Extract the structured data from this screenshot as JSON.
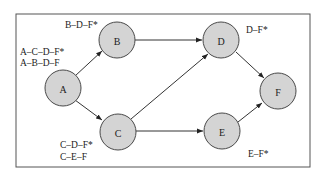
{
  "diagram": {
    "type": "directed-network",
    "nodes": [
      {
        "id": "A",
        "label": "A",
        "x": 63,
        "y": 88
      },
      {
        "id": "B",
        "label": "B",
        "x": 117,
        "y": 40
      },
      {
        "id": "C",
        "label": "C",
        "x": 118,
        "y": 132
      },
      {
        "id": "D",
        "label": "D",
        "x": 221,
        "y": 40
      },
      {
        "id": "E",
        "label": "E",
        "x": 222,
        "y": 131
      },
      {
        "id": "F",
        "label": "F",
        "x": 278,
        "y": 91
      }
    ],
    "edges": [
      {
        "from": "A",
        "to": "B"
      },
      {
        "from": "A",
        "to": "C"
      },
      {
        "from": "B",
        "to": "D"
      },
      {
        "from": "C",
        "to": "D"
      },
      {
        "from": "C",
        "to": "E"
      },
      {
        "from": "D",
        "to": "F"
      },
      {
        "from": "E",
        "to": "F"
      }
    ],
    "path_labels": {
      "A": [
        "A–C–D–F*",
        "A–B–D–F"
      ],
      "B": [
        "B–D–F*"
      ],
      "C": [
        "C–D–F*",
        "C–E–F"
      ],
      "D": [
        "D–F*"
      ],
      "E": [
        "E–F*"
      ]
    }
  }
}
